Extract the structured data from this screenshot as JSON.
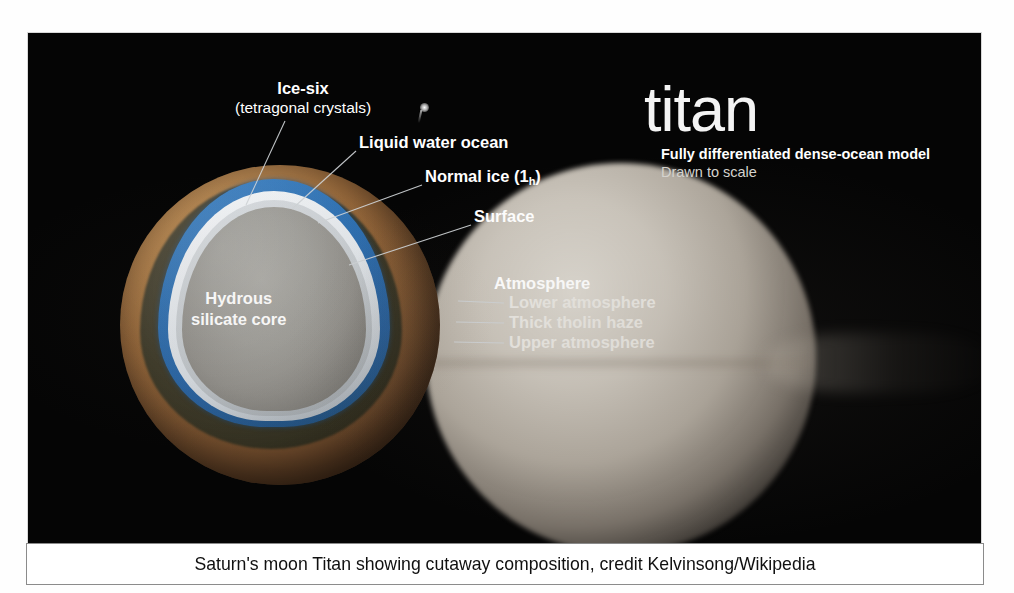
{
  "figure": {
    "title": "titan",
    "subtitle_line1": "Fully differentiated dense-ocean model",
    "subtitle_line2": "Drawn to scale",
    "caption": "Saturn's moon Titan showing cutaway composition, credit Kelvinsong/Wikipedia"
  },
  "labels": {
    "ice_six_line1": "Ice-six",
    "ice_six_line2": "(tetragonal crystals)",
    "liquid_water_ocean": "Liquid water ocean",
    "normal_ice_main": "Normal ice (1",
    "normal_ice_sub": "h",
    "normal_ice_close": ")",
    "surface": "Surface",
    "core_line1": "Hydrous",
    "core_line2": "silicate core",
    "atmosphere": "Atmosphere",
    "lower_atmosphere": "Lower atmosphere",
    "thick_tholin_haze": "Thick tholin haze",
    "upper_atmosphere": "Upper atmosphere"
  },
  "colors": {
    "background": "#050505",
    "surface_tan": "#b07f47",
    "ocean_blue": "#2e6fb0",
    "normal_ice_white": "#e2e6ea",
    "ice_six_gray": "#c3c8cc",
    "core_gray": "#9e9d98",
    "haze_orange": "#c4925c",
    "upper_atmosphere_blue": "#7692b2",
    "label_text": "#ffffff",
    "caption_text": "#101010",
    "caption_background": "#ffffff"
  }
}
